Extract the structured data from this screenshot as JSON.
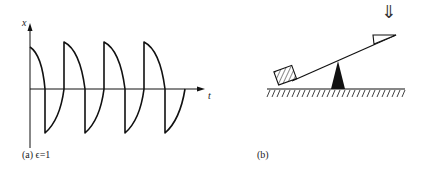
{
  "panel_a": {
    "caption": "(a) ϵ=1",
    "y_axis_label": "x",
    "x_axis_label": "t",
    "description": "Relaxation oscillation waveform: repeated jumps and slow decays crossing zero",
    "epsilon": "1"
  },
  "panel_b": {
    "caption": "(b)",
    "force_arrow": "⇓",
    "description": "Seesaw on fulcrum with hatched block on low end and triangular wedge on high end, pushed down from above"
  },
  "colors": {
    "ink": "#111111",
    "background": "#ffffff"
  }
}
